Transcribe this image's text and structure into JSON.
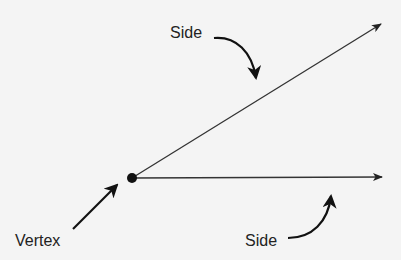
{
  "diagram": {
    "colors": {
      "background": "#f4f4f4",
      "stroke": "#222222"
    },
    "labels": {
      "side_top": "Side",
      "side_bottom": "Side",
      "vertex": "Vertex"
    },
    "vertex_point": {
      "x": 132,
      "y": 178
    },
    "rays": [
      {
        "name": "upper-ray",
        "from": [
          132,
          178
        ],
        "to": [
          382,
          23
        ]
      },
      {
        "name": "lower-ray",
        "from": [
          132,
          178
        ],
        "to": [
          383,
          177
        ]
      }
    ]
  }
}
